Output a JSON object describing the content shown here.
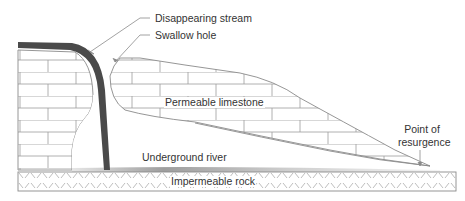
{
  "diagram": {
    "labels": {
      "disappearing_stream": "Disappearing stream",
      "swallow_hole": "Swallow hole",
      "permeable_limestone": "Permeable limestone",
      "underground_river": "Underground river",
      "point_of_resurgence_line1": "Point of",
      "point_of_resurgence_line2": "resurgence",
      "impermeable_rock": "Impermeable rock"
    },
    "colors": {
      "stream": "#4a4a4a",
      "lines": "#8a8a8a",
      "text": "#333333",
      "rock_hatch": "#9a9a9a",
      "river_shade": "#bdbdbd"
    }
  }
}
